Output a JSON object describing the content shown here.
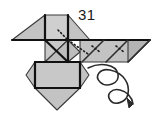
{
  "figure": {
    "number_label": "31",
    "label_position": {
      "x": 78,
      "y": 7
    },
    "caption_kind": "figure-step-number",
    "background_color": "#ffffff"
  },
  "style": {
    "paper_fill": "#c3c3c3",
    "paper_fill_light": "#cfcfcf",
    "paper_fill_dark": "#b4b4b4",
    "edge_color": "#3a3a3a",
    "crease_color": "#111111",
    "fold_dotted_color": "#1b1b1b",
    "arrow_color": "#2b2b2b",
    "edge_width": 1.1,
    "crease_width": 2.2,
    "arrow_width": 1.6
  },
  "shapes": {
    "left_wing": {
      "name": "left-wing-triangle",
      "points": "12,40 45,15 45,40"
    },
    "top_left_square": {
      "name": "top-left-square-panel",
      "points": "45,15 68,15 68,40 45,40"
    },
    "top_right_triangle": {
      "name": "top-right-triangle-panel",
      "points": "68,15 68,40 90,40"
    },
    "center_upper_left": {
      "name": "center-upper-left-triangle",
      "points": "45,40 68,40 45,62"
    },
    "center_upper_right": {
      "name": "center-upper-right-triangle",
      "points": "68,40 80,52 68,62 45,62"
    },
    "right_wing_band": {
      "name": "right-wing-band",
      "points": "80,40 150,40 128,62 80,62"
    },
    "right_wing_tip": {
      "name": "right-wing-tip-triangle",
      "points": "128,40 150,40 128,62"
    },
    "body_square": {
      "name": "body-square-panel",
      "points": "35,62 80,62 80,88 35,88"
    },
    "body_bottom_point": {
      "name": "body-bottom-point-triangle",
      "points": "35,88 80,88 57,110"
    },
    "body_left_bevel": {
      "name": "body-left-bevel",
      "points": "35,62 35,88 26,75"
    },
    "body_right_bevel": {
      "name": "body-right-bevel",
      "points": "80,62 80,88 89,75"
    }
  },
  "creases": {
    "solid": [
      {
        "name": "crease-top-square-left",
        "d": "M45,15 L45,40"
      },
      {
        "name": "crease-top-square-right",
        "d": "M68,15 L68,40"
      },
      {
        "name": "crease-mid-horizontal",
        "d": "M12,40 L150,40"
      },
      {
        "name": "crease-center-vertical",
        "d": "M68,40 L68,62"
      },
      {
        "name": "crease-body-top",
        "d": "M35,62 L80,62"
      },
      {
        "name": "crease-body-bottom",
        "d": "M35,88 L80,88"
      },
      {
        "name": "crease-body-left",
        "d": "M35,62 L35,88"
      },
      {
        "name": "crease-body-right",
        "d": "M80,62 L80,88"
      },
      {
        "name": "crease-center-diagonal",
        "d": "M45,40 L68,62"
      },
      {
        "name": "crease-wing-zig-1",
        "d": "M104,40 L82,62"
      },
      {
        "name": "crease-wing-zig-2",
        "d": "M128,40 L106,62"
      },
      {
        "name": "crease-wing-zig-3",
        "d": "M150,40 L128,62"
      }
    ],
    "dotted": [
      {
        "name": "fold-dotted-center",
        "d": "M68,40 L88,54"
      },
      {
        "name": "fold-dotted-wing-a",
        "d": "M92,46 L100,52"
      },
      {
        "name": "fold-dotted-wing-b",
        "d": "M116,46 L124,52"
      },
      {
        "name": "fold-dotted-upper",
        "d": "M58,30 L68,40"
      }
    ]
  },
  "arrow": {
    "name": "flip-spiral-arrow",
    "kind": "double-loop-turnover-arrow",
    "path": "M88,68 C100,62 116,64 118,74 C120,84 106,88 100,82 C94,76 100,68 110,70 C124,73 130,84 128,94 C126,103 114,106 110,100 C106,94 112,88 120,90 C128,92 132,98 133,104",
    "head": "133,104 127,98 129,108"
  }
}
